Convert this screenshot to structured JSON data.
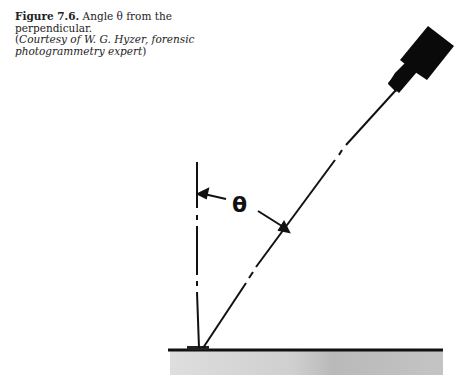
{
  "figure": {
    "label": "Figure 7.6.",
    "title": "Angle θ from the perpendicular.",
    "credit_open": "(",
    "credit": "Courtesy of W. G. Hyzer, forensic photogrammetry expert",
    "credit_close": ")"
  },
  "diagram": {
    "angle_symbol": "θ",
    "elements": [
      "camera",
      "line-of-sight",
      "perpendicular",
      "ground-surface",
      "subject-marker",
      "angle-arc-arrows"
    ],
    "colors": {
      "ink": "#111111",
      "ground": "#c8c8c8"
    }
  }
}
